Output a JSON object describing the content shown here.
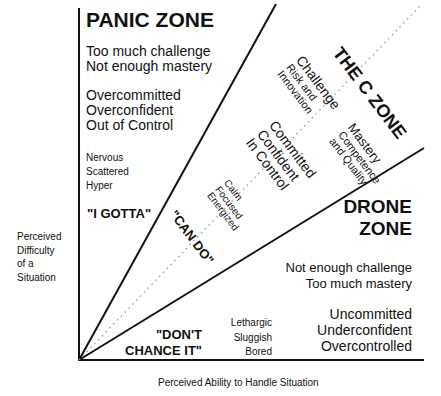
{
  "panic_zone": {
    "title": "PANIC ZONE",
    "lines1": [
      "Too much challenge",
      "Not enough mastery"
    ],
    "lines2": [
      "Overcommitted",
      "Overconfident",
      "Out of Control"
    ],
    "lines3": [
      "Nervous",
      "Scattered",
      "Hyper"
    ],
    "quote": "\"I GOTTA\""
  },
  "c_zone": {
    "title": "THE C ZONE",
    "challenge": [
      "Challenge",
      "Risk and",
      "Innovation"
    ],
    "committed": [
      "Committed",
      "Confident",
      "In Control"
    ],
    "mastery": [
      "Mastery",
      "Competence",
      "and Quality"
    ],
    "calm": [
      "Calm",
      "Focused",
      "Energized"
    ],
    "quote": "\"CAN DO\""
  },
  "drone_zone": {
    "title": [
      "DRONE",
      "ZONE"
    ],
    "lines1": [
      "Not enough challenge",
      "Too much mastery"
    ],
    "lines2": [
      "Uncommitted",
      "Underconfident",
      "Overcontrolled"
    ],
    "lines3": [
      "Lethargic",
      "Sluggish",
      "Bored"
    ],
    "quote": [
      "\"DON'T",
      "CHANCE IT\""
    ]
  },
  "axes": {
    "y_label": [
      "Perceived",
      "Difficulty",
      "of a",
      "Situation"
    ],
    "x_label": "Perceived Ability to Handle Situation"
  },
  "colors": {
    "ink": "#111111",
    "dotted": "#999999",
    "background": "#ffffff"
  }
}
